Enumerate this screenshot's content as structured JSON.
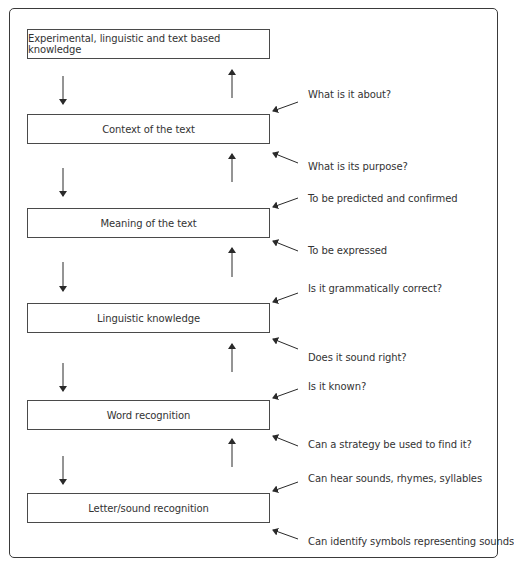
{
  "diagram": {
    "boxes": [
      {
        "label": "Experimental, linguistic and text based knowledge",
        "top": 29
      },
      {
        "label": "Context of the text",
        "top": 114
      },
      {
        "label": "Meaning of the text",
        "top": 208
      },
      {
        "label": "Linguistic knowledge",
        "top": 303
      },
      {
        "label": "Word recognition",
        "top": 400
      },
      {
        "label": "Letter/sound recognition",
        "top": 493
      }
    ],
    "annotations": [
      {
        "text": "What is it about?",
        "top": 95
      },
      {
        "text": "What is its purpose?",
        "top": 163
      },
      {
        "text": "To be predicted and confirmed",
        "top": 194
      },
      {
        "text": "To be expressed",
        "top": 245
      },
      {
        "text": "Is it grammatically correct?",
        "top": 282
      },
      {
        "text": "Does it sound right?",
        "top": 350
      },
      {
        "text": "Is it known?",
        "top": 380
      },
      {
        "text": "Can a strategy be used to find it?",
        "top": 442
      },
      {
        "text": "Can hear sounds, rhymes, syllables",
        "top": 473
      },
      {
        "text": "Can identify symbols representing sounds",
        "top": 537
      }
    ],
    "connectors": {
      "down_arrow_label": "top-down flow",
      "up_arrow_label": "bottom-up flow"
    },
    "colors": {
      "line": "#2a2a2a",
      "text": "#333333",
      "border": "#3a3a3a"
    }
  }
}
